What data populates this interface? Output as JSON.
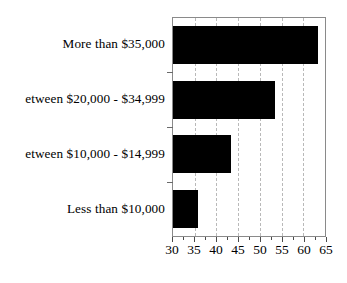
{
  "chart_data": {
    "type": "bar",
    "orientation": "horizontal",
    "title": "",
    "subtitle": "",
    "xlabel": "",
    "ylabel": "",
    "categories": [
      "More than $35,000",
      "etween $20,000 - $34,999",
      "etween $10,000 - $14,999",
      "Less than $10,000"
    ],
    "values": [
      63.5,
      53.4,
      43.4,
      35.7
    ],
    "series": [
      {
        "name": "",
        "values": [
          63.5,
          53.4,
          43.4,
          35.7
        ]
      }
    ],
    "xlim": [
      30,
      65
    ],
    "xticks": [
      30,
      35,
      40,
      45,
      50,
      55,
      60,
      65
    ],
    "xtick_labels": [
      "30",
      "35",
      "40",
      "45",
      "50",
      "55",
      "60",
      "65"
    ],
    "minor_xticks": [
      32.5,
      37.5,
      42.5,
      47.5,
      52.5,
      57.5,
      62.5
    ],
    "grid": true,
    "grid_axis": "x",
    "grid_style": "dashed",
    "legend": false,
    "legend_position": "none",
    "bar_color": "#000000",
    "grid_color": "#b9b9b9",
    "frame_color": "#8a8a8a",
    "tick_color": "#4a4a4a"
  }
}
